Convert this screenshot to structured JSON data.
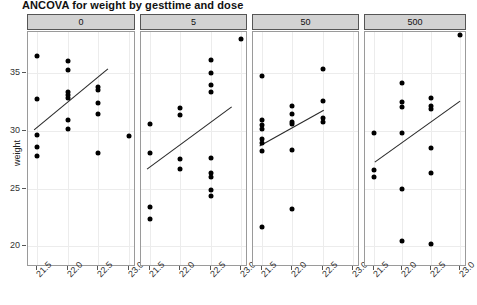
{
  "chart_data": {
    "type": "scatter",
    "title": "ANCOVA for weight by gesttime and dose",
    "xlabel": "",
    "ylabel": "weight",
    "xlim": [
      21.35,
      23.12
    ],
    "ylim": [
      18.2,
      38.6
    ],
    "xticks": [
      21.5,
      22.0,
      22.5,
      23.0
    ],
    "xtick_labels": [
      "21.5",
      "22.0",
      "22.5",
      "23.0"
    ],
    "yticks": [
      20,
      25,
      30,
      35
    ],
    "ytick_labels": [
      "20",
      "25",
      "30",
      "35"
    ],
    "grid": true,
    "legend": "none",
    "facet_variable": "dose",
    "panels": [
      {
        "label": "0",
        "points": [
          {
            "x": 21.5,
            "y": 36.5
          },
          {
            "x": 21.5,
            "y": 32.8
          },
          {
            "x": 21.5,
            "y": 29.7
          },
          {
            "x": 21.5,
            "y": 28.6
          },
          {
            "x": 21.5,
            "y": 27.8
          },
          {
            "x": 22.0,
            "y": 36.1
          },
          {
            "x": 22.0,
            "y": 35.3
          },
          {
            "x": 22.0,
            "y": 33.4
          },
          {
            "x": 22.0,
            "y": 33.1
          },
          {
            "x": 22.0,
            "y": 32.9
          },
          {
            "x": 22.0,
            "y": 31.0
          },
          {
            "x": 22.0,
            "y": 30.2
          },
          {
            "x": 22.5,
            "y": 33.8
          },
          {
            "x": 22.5,
            "y": 33.6
          },
          {
            "x": 22.5,
            "y": 32.4
          },
          {
            "x": 22.5,
            "y": 31.5
          },
          {
            "x": 22.5,
            "y": 28.1
          },
          {
            "x": 23.0,
            "y": 29.6
          }
        ],
        "fit": {
          "x0": 21.45,
          "y0": 30.1,
          "x1": 22.66,
          "y1": 35.4
        }
      },
      {
        "label": "5",
        "points": [
          {
            "x": 21.5,
            "y": 30.6
          },
          {
            "x": 21.5,
            "y": 28.1
          },
          {
            "x": 21.5,
            "y": 23.4
          },
          {
            "x": 21.5,
            "y": 22.4
          },
          {
            "x": 22.0,
            "y": 32.0
          },
          {
            "x": 22.0,
            "y": 31.4
          },
          {
            "x": 22.0,
            "y": 27.6
          },
          {
            "x": 22.0,
            "y": 26.7
          },
          {
            "x": 22.5,
            "y": 36.2
          },
          {
            "x": 22.5,
            "y": 35.0
          },
          {
            "x": 22.5,
            "y": 34.0
          },
          {
            "x": 22.5,
            "y": 33.4
          },
          {
            "x": 22.5,
            "y": 27.7
          },
          {
            "x": 22.5,
            "y": 26.4
          },
          {
            "x": 22.5,
            "y": 26.0
          },
          {
            "x": 22.5,
            "y": 24.9
          },
          {
            "x": 22.5,
            "y": 24.4
          },
          {
            "x": 23.0,
            "y": 38.0
          }
        ],
        "fit": {
          "x0": 21.45,
          "y0": 26.7,
          "x1": 22.85,
          "y1": 32.1
        }
      },
      {
        "label": "50",
        "points": [
          {
            "x": 21.5,
            "y": 34.8
          },
          {
            "x": 21.5,
            "y": 31.0
          },
          {
            "x": 21.5,
            "y": 30.5
          },
          {
            "x": 21.5,
            "y": 30.2
          },
          {
            "x": 21.5,
            "y": 29.3
          },
          {
            "x": 21.5,
            "y": 29.0
          },
          {
            "x": 21.5,
            "y": 28.3
          },
          {
            "x": 21.5,
            "y": 21.7
          },
          {
            "x": 22.0,
            "y": 32.2
          },
          {
            "x": 22.0,
            "y": 31.5
          },
          {
            "x": 22.0,
            "y": 30.8
          },
          {
            "x": 22.0,
            "y": 30.6
          },
          {
            "x": 22.0,
            "y": 28.4
          },
          {
            "x": 22.0,
            "y": 23.2
          },
          {
            "x": 22.5,
            "y": 35.4
          },
          {
            "x": 22.5,
            "y": 32.6
          },
          {
            "x": 22.5,
            "y": 31.1
          },
          {
            "x": 22.5,
            "y": 30.8
          }
        ],
        "fit": {
          "x0": 21.46,
          "y0": 28.7,
          "x1": 22.52,
          "y1": 31.8
        }
      },
      {
        "label": "500",
        "points": [
          {
            "x": 21.5,
            "y": 29.8
          },
          {
            "x": 21.5,
            "y": 26.6
          },
          {
            "x": 21.5,
            "y": 26.0
          },
          {
            "x": 22.0,
            "y": 34.2
          },
          {
            "x": 22.0,
            "y": 32.5
          },
          {
            "x": 22.0,
            "y": 32.1
          },
          {
            "x": 22.0,
            "y": 29.8
          },
          {
            "x": 22.0,
            "y": 25.0
          },
          {
            "x": 22.0,
            "y": 20.5
          },
          {
            "x": 22.5,
            "y": 32.9
          },
          {
            "x": 22.5,
            "y": 32.2
          },
          {
            "x": 22.5,
            "y": 31.9
          },
          {
            "x": 22.5,
            "y": 28.5
          },
          {
            "x": 22.5,
            "y": 26.4
          },
          {
            "x": 22.5,
            "y": 20.2
          },
          {
            "x": 23.0,
            "y": 38.3
          }
        ],
        "fit": {
          "x0": 21.52,
          "y0": 27.3,
          "x1": 23.0,
          "y1": 32.6
        }
      }
    ]
  },
  "colors": {
    "point": "#000000",
    "line": "#2a2a2a",
    "strip_bg": "#d2d2d2",
    "grid": "#ececec",
    "panel_border": "#9a9a9a"
  }
}
